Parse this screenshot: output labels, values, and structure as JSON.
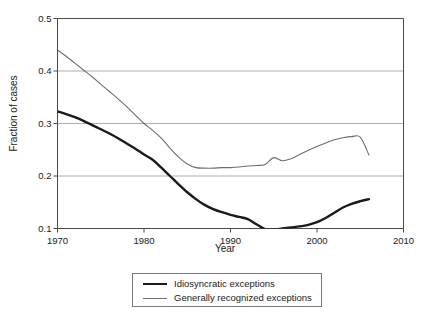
{
  "chart_data": {
    "type": "line",
    "title": "",
    "xlabel": "Year",
    "ylabel": "Fraction of cases",
    "xlim": [
      1970,
      2010
    ],
    "ylim": [
      0.1,
      0.5
    ],
    "xticks": [
      1970,
      1980,
      1990,
      2000,
      2010
    ],
    "xtick_labels": [
      "1970",
      "1980",
      "1990",
      "2000",
      "2010"
    ],
    "yticks": [
      0.1,
      0.2,
      0.3,
      0.4,
      0.5
    ],
    "ytick_labels": [
      "0.1",
      "0.2",
      "0.3",
      "0.4",
      "0.5"
    ],
    "grid": "horizontal",
    "legend_position": "below-center",
    "series": [
      {
        "name": "Idiosyncratic exceptions",
        "color": "#1a1a1a",
        "width": 2.4,
        "x": [
          1970,
          1971,
          1972,
          1973,
          1974,
          1975,
          1976,
          1977,
          1978,
          1979,
          1980,
          1981,
          1982,
          1983,
          1984,
          1985,
          1986,
          1987,
          1988,
          1989,
          1990,
          1991,
          1992,
          1993,
          1994,
          1995,
          1996,
          1997,
          1998,
          1999,
          2000,
          2001,
          2002,
          2003,
          2004,
          2005,
          2006
        ],
        "y": [
          0.323,
          0.318,
          0.312,
          0.305,
          0.297,
          0.289,
          0.281,
          0.272,
          0.262,
          0.252,
          0.241,
          0.231,
          0.216,
          0.2,
          0.184,
          0.169,
          0.156,
          0.145,
          0.137,
          0.131,
          0.126,
          0.122,
          0.118,
          0.108,
          0.099,
          0.098,
          0.1,
          0.102,
          0.104,
          0.107,
          0.112,
          0.12,
          0.13,
          0.14,
          0.147,
          0.152,
          0.156
        ]
      },
      {
        "name": "Generally recognized exceptions",
        "color": "#6e6e6e",
        "width": 1.1,
        "x": [
          1970,
          1971,
          1972,
          1973,
          1974,
          1975,
          1976,
          1977,
          1978,
          1979,
          1980,
          1981,
          1982,
          1983,
          1984,
          1985,
          1986,
          1987,
          1988,
          1989,
          1990,
          1991,
          1992,
          1993,
          1994,
          1995,
          1996,
          1997,
          1998,
          1999,
          2000,
          2001,
          2002,
          2003,
          2004,
          2005,
          2006
        ],
        "y": [
          0.44,
          0.428,
          0.415,
          0.402,
          0.389,
          0.375,
          0.361,
          0.347,
          0.332,
          0.316,
          0.3,
          0.287,
          0.272,
          0.253,
          0.236,
          0.223,
          0.216,
          0.215,
          0.215,
          0.216,
          0.216,
          0.217,
          0.219,
          0.22,
          0.222,
          0.235,
          0.229,
          0.233,
          0.241,
          0.249,
          0.256,
          0.263,
          0.269,
          0.273,
          0.275,
          0.274,
          0.24
        ]
      }
    ]
  },
  "legend": {
    "items": [
      {
        "label": "Idiosyncratic exceptions"
      },
      {
        "label": "Generally recognized exceptions"
      }
    ]
  }
}
